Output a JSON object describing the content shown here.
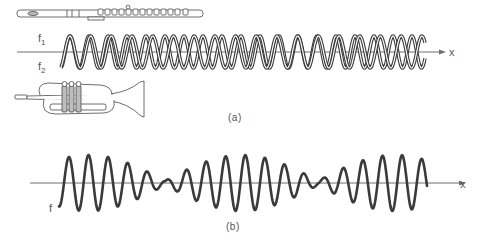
{
  "figure": {
    "panel_a": {
      "caption": "(a)",
      "wave_labels": {
        "f1": "f",
        "f1_sub": "1",
        "f2": "f",
        "f2_sub": "2"
      },
      "axis_label": "x",
      "instruments": [
        "flute",
        "trumpet"
      ],
      "description": "Two sinusoids of slightly different frequency f1 and f2 drawn superimposed along the x axis"
    },
    "panel_b": {
      "caption": "(b)",
      "wave_label": "f",
      "axis_label": "x",
      "description": "Resultant wave showing beats: amplitude modulated envelope with two minima"
    },
    "colors": {
      "wave": "#3a3a3a",
      "axis": "#6e6e6e",
      "text": "#555555",
      "background": "#ffffff"
    },
    "geometry": {
      "a": {
        "axis_y": 52,
        "axis_x0": 17,
        "axis_x1": 446,
        "wave_x0": 61,
        "wave_x1": 425,
        "amplitude": 16,
        "period1": 19.0,
        "period2": 20.7
      },
      "b": {
        "axis_y": 183,
        "axis_x0": 30,
        "axis_x1": 466,
        "wave_x0": 59,
        "wave_x1": 427,
        "amplitude": 28,
        "carrier_period": 19.6,
        "beat_period": 153,
        "minima_x": [
          165,
          318
        ]
      }
    }
  }
}
